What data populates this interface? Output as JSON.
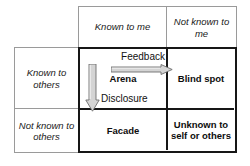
{
  "diagram": {
    "column_headers": [
      {
        "id": "known-to-me",
        "label": "Known to me"
      },
      {
        "id": "not-known-to-me",
        "label": "Not known to me"
      }
    ],
    "row_headers": [
      {
        "id": "known-to-others",
        "label": "Known to others"
      },
      {
        "id": "not-known-to-others",
        "label": "Not known to others"
      }
    ],
    "quadrants": [
      {
        "id": "arena",
        "label": "Arena"
      },
      {
        "id": "blind-spot",
        "label": "Blind spot"
      },
      {
        "id": "facade",
        "label": "Facade"
      },
      {
        "id": "unknown-to-self-or-others",
        "label": "Unknown to self or others"
      }
    ],
    "arrows": [
      {
        "id": "feedback",
        "label": "Feedback",
        "direction": "right"
      },
      {
        "id": "disclosure",
        "label": "Disclosure",
        "direction": "down"
      }
    ],
    "colors": {
      "arrow_fill": "#d4d4d4",
      "arrow_stroke": "#6e6e6e",
      "grid_bold": "#161616",
      "grid_light": "#9a9a9a",
      "text": "#111111",
      "background": "#ffffff"
    }
  }
}
